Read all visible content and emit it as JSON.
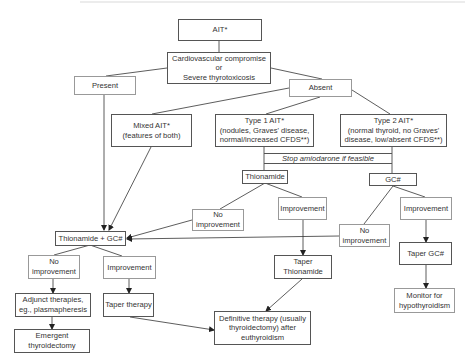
{
  "diagram": {
    "nodes": {
      "ait": "AIT*",
      "cardio": "Cardiovascular compromise\nor\nSevere thyrotoxicosis",
      "present": "Present",
      "absent": "Absent",
      "mixed": "Mixed AIT*\n(features of both)",
      "type1": "Type 1 AIT*\n(nodules, Graves' disease,\nnormal/increased CFDS**)",
      "type2": "Type 2 AIT*\n(normal thyroid, no Graves'\ndisease, low/absent CFDS**)",
      "stop": "Stop amiodarone if feasible",
      "thionamide": "Thionamide",
      "gc": "GC#",
      "no_improvement_mid": "No\nimprovement",
      "improvement_mid": "Improvement",
      "no_improvement_right": "No\nimprovement",
      "improvement_right": "Improvement",
      "thionamide_gc": "Thionamide + GC#",
      "no_improvement_left": "No\nimprovement",
      "improvement_left": "Improvement",
      "taper_thionamide": "Taper\nThionamide",
      "taper_gc": "Taper GC#",
      "adjunct": "Adjunct therapies,\neg., plasmapheresis",
      "taper_therapy": "Taper therapy",
      "monitor": "Monitor for\nhypothyroidism",
      "emergent": "Emergent\nthyroidectomy",
      "definitive": "Definitive therapy (usually\nthyroidectomy) after\neuthyroidism"
    },
    "colors": {
      "line": "#333333",
      "border": "#555555",
      "background": "#ffffff"
    }
  }
}
